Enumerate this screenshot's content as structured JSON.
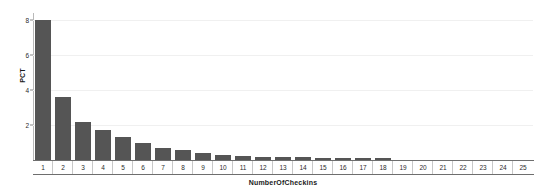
{
  "chart_data": {
    "type": "bar",
    "title": "",
    "xlabel": "NumberOfCheckins",
    "ylabel": "PCT",
    "categories": [
      "1",
      "2",
      "3",
      "4",
      "5",
      "6",
      "7",
      "8",
      "9",
      "10",
      "11",
      "12",
      "13",
      "14",
      "15",
      "16",
      "17",
      "18",
      "19",
      "20",
      "21",
      "22",
      "23",
      "24",
      "25"
    ],
    "values": [
      8.0,
      3.6,
      2.2,
      1.7,
      1.3,
      0.95,
      0.7,
      0.55,
      0.4,
      0.3,
      0.25,
      0.2,
      0.2,
      0.15,
      0.12,
      0.12,
      0.1,
      0.1,
      0.0,
      0.0,
      0.0,
      0.0,
      0.0,
      0.0,
      0.0
    ],
    "ylim": [
      0,
      8.4
    ],
    "yticks": [
      2,
      4,
      6,
      8
    ],
    "ytick_labels": [
      "2",
      "4",
      "6",
      "8"
    ],
    "grid": true,
    "legend": false,
    "bar_color": "#555555",
    "gridline_color": "#f0f0f0",
    "axis_color": "#6e6e6e",
    "background": "#ffffff"
  }
}
